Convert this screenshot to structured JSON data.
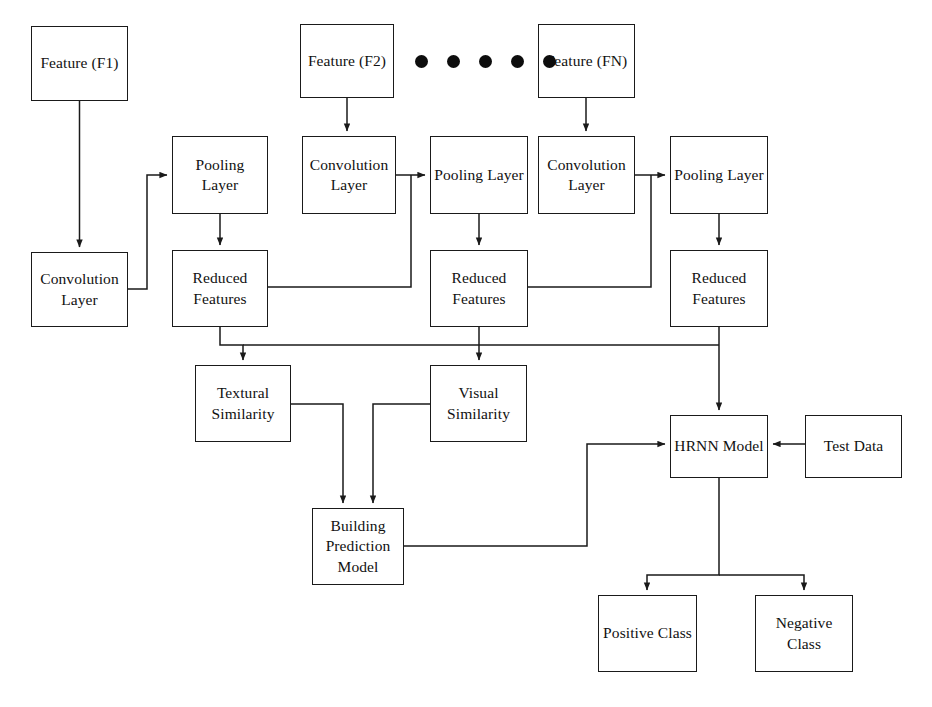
{
  "diagram": {
    "background_color": "#ffffff",
    "line_color": "#1a1a1a",
    "text_color": "#111111",
    "ellipsis_dot_count": 5,
    "nodes": [
      {
        "id": "feature_f1",
        "label": "Feature (F1)",
        "x": 31,
        "y": 26,
        "w": 97,
        "h": 75
      },
      {
        "id": "feature_f2",
        "label": "Feature (F2)",
        "x": 300,
        "y": 24,
        "w": 94,
        "h": 74
      },
      {
        "id": "feature_fn",
        "label": "Feature (FN)",
        "x": 538,
        "y": 24,
        "w": 97,
        "h": 74
      },
      {
        "id": "pooling_layer_1",
        "label": "Pooling Layer",
        "x": 172,
        "y": 136,
        "w": 96,
        "h": 78
      },
      {
        "id": "convolution_2",
        "label": "Convolution\nLayer",
        "x": 302,
        "y": 136,
        "w": 94,
        "h": 78
      },
      {
        "id": "pooling_layer_2",
        "label": "Pooling Layer",
        "x": 430,
        "y": 136,
        "w": 98,
        "h": 78
      },
      {
        "id": "convolution_3",
        "label": "Convolution\nLayer",
        "x": 538,
        "y": 136,
        "w": 97,
        "h": 78
      },
      {
        "id": "pooling_layer_3",
        "label": "Pooling Layer",
        "x": 670,
        "y": 136,
        "w": 98,
        "h": 78
      },
      {
        "id": "convolution_1",
        "label": "Convolution\nLayer",
        "x": 31,
        "y": 252,
        "w": 97,
        "h": 75
      },
      {
        "id": "reduced_features_1",
        "label": "Reduced\nFeatures",
        "x": 172,
        "y": 250,
        "w": 96,
        "h": 77
      },
      {
        "id": "reduced_features_2",
        "label": "Reduced\nFeatures",
        "x": 430,
        "y": 250,
        "w": 98,
        "h": 77
      },
      {
        "id": "reduced_features_3",
        "label": "Reduced\nFeatures",
        "x": 670,
        "y": 250,
        "w": 98,
        "h": 77
      },
      {
        "id": "textural_similarity",
        "label": "Textural\nSimilarity",
        "x": 195,
        "y": 365,
        "w": 96,
        "h": 77
      },
      {
        "id": "visual_similarity",
        "label": "Visual\nSimilarity",
        "x": 430,
        "y": 365,
        "w": 97,
        "h": 77
      },
      {
        "id": "hrnn_model",
        "label": "HRNN Model",
        "x": 670,
        "y": 415,
        "w": 98,
        "h": 63
      },
      {
        "id": "test_data",
        "label": "Test Data",
        "x": 805,
        "y": 415,
        "w": 97,
        "h": 63
      },
      {
        "id": "building_prediction",
        "label": "Building\nPrediction\nModel",
        "x": 312,
        "y": 508,
        "w": 92,
        "h": 77
      },
      {
        "id": "positive_class",
        "label": "Positive Class",
        "x": 598,
        "y": 595,
        "w": 99,
        "h": 77
      },
      {
        "id": "negative_class",
        "label": "Negative\nClass",
        "x": 755,
        "y": 595,
        "w": 98,
        "h": 77
      }
    ],
    "edges": [
      {
        "id": "f1-to-conv1",
        "from": "feature_f1",
        "to": "convolution_1",
        "arrow": true
      },
      {
        "id": "conv1-to-pool1",
        "from": "convolution_1",
        "to": "pooling_layer_1",
        "arrow": true
      },
      {
        "id": "pool1-to-rf1",
        "from": "pooling_layer_1",
        "to": "reduced_features_1",
        "arrow": true
      },
      {
        "id": "f2-to-conv2",
        "from": "feature_f2",
        "to": "convolution_2",
        "arrow": true
      },
      {
        "id": "conv2-to-pool2",
        "from": "convolution_2",
        "to": "pooling_layer_2",
        "arrow": true
      },
      {
        "id": "pool2-to-rf2",
        "from": "pooling_layer_2",
        "to": "reduced_features_2",
        "arrow": true
      },
      {
        "id": "fn-to-conv3",
        "from": "feature_fn",
        "to": "convolution_3",
        "arrow": true
      },
      {
        "id": "conv3-to-pool3",
        "from": "convolution_3",
        "to": "pooling_layer_3",
        "arrow": true
      },
      {
        "id": "pool3-to-rf3",
        "from": "pooling_layer_3",
        "to": "reduced_features_3",
        "arrow": true
      },
      {
        "id": "rf1-to-conv3feed",
        "from": "reduced_features_1",
        "to": "convolution_3",
        "arrow": false
      },
      {
        "id": "rf2-to-right",
        "from": "reduced_features_2",
        "to": "pooling_layer_3",
        "arrow": false
      },
      {
        "id": "rf1-to-textural",
        "from": "reduced_features_1",
        "to": "textural_similarity",
        "arrow": true
      },
      {
        "id": "rf2-to-visual",
        "from": "reduced_features_2",
        "to": "visual_similarity",
        "arrow": true
      },
      {
        "id": "rf3-to-hrnn",
        "from": "reduced_features_3",
        "to": "hrnn_model",
        "arrow": true
      },
      {
        "id": "textural-to-bpm",
        "from": "textural_similarity",
        "to": "building_prediction",
        "arrow": true
      },
      {
        "id": "visual-to-bpm",
        "from": "visual_similarity",
        "to": "building_prediction",
        "arrow": true
      },
      {
        "id": "bpm-to-hrnn",
        "from": "building_prediction",
        "to": "hrnn_model",
        "arrow": true
      },
      {
        "id": "testdata-to-hrnn",
        "from": "test_data",
        "to": "hrnn_model",
        "arrow": true
      },
      {
        "id": "hrnn-to-positive",
        "from": "hrnn_model",
        "to": "positive_class",
        "arrow": true
      },
      {
        "id": "hrnn-to-negative",
        "from": "hrnn_model",
        "to": "negative_class",
        "arrow": true
      }
    ],
    "ellipsis": {
      "x": 415,
      "y": 55,
      "label": "feature-sequence-ellipsis"
    }
  }
}
